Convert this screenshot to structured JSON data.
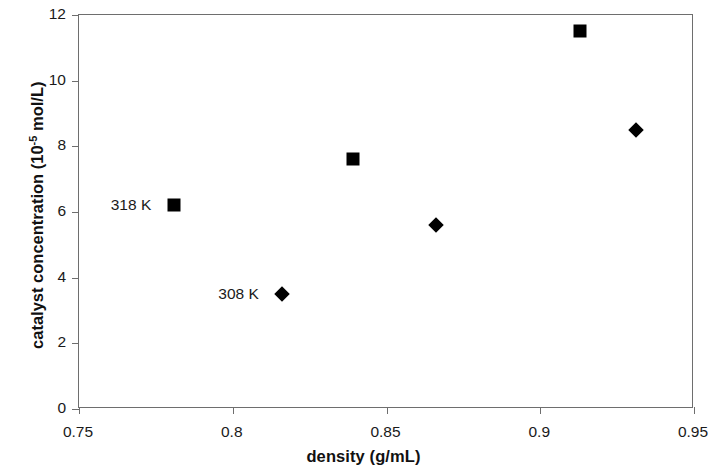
{
  "chart_data": {
    "type": "scatter",
    "title": "",
    "xlabel": "density (g/mL)",
    "ylabel": "catalyst concentration (10 -5 mol/L)",
    "ylabel_main": "catalyst concentration (10",
    "ylabel_exponent": "-5",
    "ylabel_tail": " mol/L)",
    "xlim": [
      0.75,
      0.95
    ],
    "ylim": [
      0,
      12
    ],
    "xticks": [
      0.75,
      0.8,
      0.85,
      0.9,
      0.95
    ],
    "xtick_labels": [
      "0.75",
      "0.8",
      "0.85",
      "0.9",
      "0.95"
    ],
    "yticks": [
      0,
      2,
      4,
      6,
      8,
      10,
      12
    ],
    "ytick_labels": [
      "0",
      "2",
      "4",
      "6",
      "8",
      "10",
      "12"
    ],
    "grid": false,
    "legend_position": "inline-annotations",
    "series": [
      {
        "name": "318 K",
        "marker": "square",
        "color": "#000000",
        "points": [
          {
            "x": 0.781,
            "y": 6.2
          },
          {
            "x": 0.839,
            "y": 7.6
          },
          {
            "x": 0.913,
            "y": 11.5
          }
        ]
      },
      {
        "name": "308 K",
        "marker": "diamond",
        "color": "#000000",
        "points": [
          {
            "x": 0.816,
            "y": 3.5
          },
          {
            "x": 0.866,
            "y": 5.6
          },
          {
            "x": 0.931,
            "y": 8.5
          }
        ]
      }
    ],
    "annotations": [
      {
        "text": "318 K",
        "x": 0.7735,
        "y": 6.2,
        "anchor": "right-of-text"
      },
      {
        "text": "308 K",
        "x": 0.8085,
        "y": 3.5,
        "anchor": "right-of-text"
      }
    ]
  },
  "colors": {
    "marker": "#000000",
    "axis": "#6e6e6e",
    "text": "#1a1a1a",
    "background": "#ffffff"
  }
}
